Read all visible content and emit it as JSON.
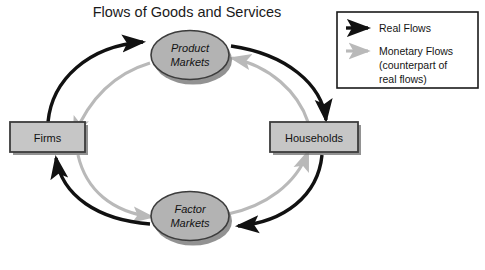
{
  "title": "Flows of Goods and Services",
  "colors": {
    "real_flow": "#111111",
    "monetary_flow": "#b9b9b9",
    "node_fill_ellipse": "#b3b3b3",
    "node_fill_box": "#c6c6c6",
    "node_border": "#3c3c3c",
    "shadow": "#6e6e6e",
    "background": "#ffffff",
    "legend_border": "#1a1a1a"
  },
  "nodes": [
    {
      "id": "product-markets",
      "label_line1": "Product",
      "label_line2": "Markets",
      "shape": "ellipse"
    },
    {
      "id": "firms",
      "label_line1": "Firms",
      "label_line2": "",
      "shape": "box"
    },
    {
      "id": "households",
      "label_line1": "Households",
      "label_line2": "",
      "shape": "box"
    },
    {
      "id": "factor-markets",
      "label_line1": "Factor",
      "label_line2": "Markets",
      "shape": "ellipse"
    }
  ],
  "flows": [
    {
      "id": "firms-to-product-markets",
      "type": "real",
      "from": "firms",
      "to": "product-markets"
    },
    {
      "id": "product-markets-to-households",
      "type": "real",
      "from": "product-markets",
      "to": "households"
    },
    {
      "id": "households-to-factor-markets",
      "type": "real",
      "from": "households",
      "to": "factor-markets"
    },
    {
      "id": "factor-markets-to-firms",
      "type": "real",
      "from": "factor-markets",
      "to": "firms"
    },
    {
      "id": "product-markets-to-firms",
      "type": "monetary",
      "from": "product-markets",
      "to": "firms"
    },
    {
      "id": "households-to-product-markets",
      "type": "monetary",
      "from": "households",
      "to": "product-markets"
    },
    {
      "id": "factor-markets-to-households",
      "type": "monetary",
      "from": "factor-markets",
      "to": "households"
    },
    {
      "id": "firms-to-factor-markets",
      "type": "monetary",
      "from": "firms",
      "to": "factor-markets"
    }
  ],
  "legend": {
    "items": [
      {
        "id": "real-flows",
        "label": "Real Flows",
        "arrow": "black-arrow-icon"
      },
      {
        "id": "monetary-flows",
        "label_line1": "Monetary Flows",
        "label_line2": "(counterpart of",
        "label_line3": "real flows)",
        "arrow": "gray-arrow-icon"
      }
    ]
  }
}
